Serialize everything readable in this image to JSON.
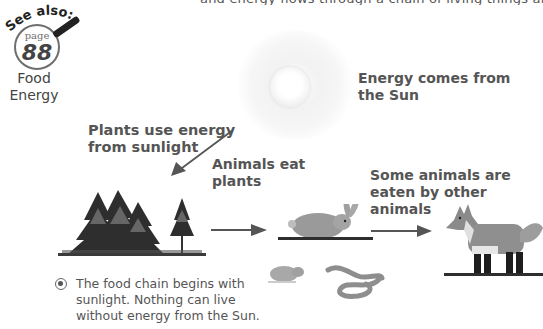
{
  "header": {
    "clipped_text_fragment": "and energy flows through a chain of living things and people"
  },
  "see_also": {
    "heading": "See also:",
    "page_label": "page",
    "page_number": "88",
    "topic_line1": "Food",
    "topic_line2": "Energy",
    "icon": "magnifying-glass-icon"
  },
  "diagram": {
    "title": "Food chain",
    "labels": {
      "sun": [
        "Energy comes from",
        "the Sun"
      ],
      "plants": [
        "Plants use energy",
        "from sunlight"
      ],
      "herbivores": [
        "Animals eat",
        "plants"
      ],
      "predators": [
        "Some animals are",
        "eaten by other",
        "animals"
      ]
    },
    "stages": [
      {
        "name": "Sun",
        "icon": "sun-icon"
      },
      {
        "name": "Trees",
        "icon": "trees-illustration"
      },
      {
        "name": "Rabbit, mouse, snake",
        "icon": "small-animals-illustration"
      },
      {
        "name": "Fox",
        "icon": "fox-illustration"
      }
    ],
    "arrows": [
      "sun-to-plants",
      "plants-to-animals",
      "animals-to-fox"
    ]
  },
  "caption": {
    "bullet_icon": "target-bullet-icon",
    "lines": [
      "The food chain begins with",
      "sunlight. Nothing can live",
      "without energy from the Sun."
    ]
  },
  "colors": {
    "text": "#555555",
    "arrow": "#555555",
    "tree_dark": "#2b2b2b",
    "animal_gray": "#9a9a9a"
  }
}
